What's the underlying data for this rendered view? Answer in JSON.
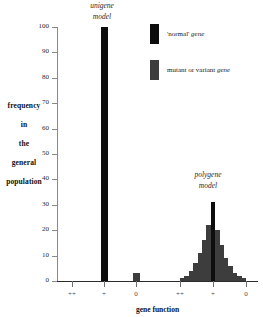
{
  "chart_data": {
    "type": "bar",
    "title": "",
    "xlabel": "gene function",
    "ylabel": "frequency in the general population",
    "ylim": [
      0,
      100
    ],
    "ytick_values": [
      0,
      10,
      20,
      30,
      40,
      50,
      60,
      70,
      80,
      90,
      100
    ],
    "grid": false,
    "legend_position": "top-right",
    "xtick_labels": [
      "++",
      "+",
      "0"
    ],
    "panels": [
      {
        "name": "unigene",
        "caption_line1": "unigene",
        "caption_line2": "model",
        "categories": [
          "++",
          "+",
          "0"
        ],
        "series": [
          {
            "name": "'normal' gene",
            "values": [
              0,
              100,
              0
            ],
            "color": "#0d0d0d"
          },
          {
            "name": "mutant or variant gene",
            "values": [
              0,
              0,
              3
            ],
            "color": "#3d3d3d"
          }
        ]
      },
      {
        "name": "polygene",
        "caption_line1": "polygene",
        "caption_line2": "model",
        "categories": [
          "++",
          "+",
          "0"
        ],
        "values": [
          1,
          2,
          4,
          7,
          11,
          16,
          22,
          31,
          20,
          14,
          9,
          6,
          3,
          2,
          1
        ],
        "peak_value": 31,
        "peak_color": "#0d0d0d",
        "bar_color": "#3d3d3d"
      }
    ]
  },
  "ylabel_lines": [
    "frequency",
    "in",
    "the",
    "general",
    "population"
  ],
  "xaxis": {
    "title": "gene function",
    "panel1_ticks": [
      "++",
      "+",
      "0"
    ],
    "panel2_ticks": [
      "++",
      "+",
      "0"
    ]
  },
  "yaxis": {
    "ticks": [
      "100",
      "90",
      "80",
      "70",
      "60",
      "50",
      "40",
      "30",
      "20",
      "10",
      "0"
    ]
  },
  "captions": {
    "unigene_l1": "unigene",
    "unigene_l2": "model",
    "polygene_l1": "polygene",
    "polygene_l2": "model"
  },
  "legend": {
    "items": [
      {
        "label_pre": "'normal' ",
        "label_em": "gene",
        "color": "#0d0d0d"
      },
      {
        "label_pre": "mutant or variant ",
        "label_em": "gene",
        "color": "#3d3d3d"
      }
    ]
  }
}
